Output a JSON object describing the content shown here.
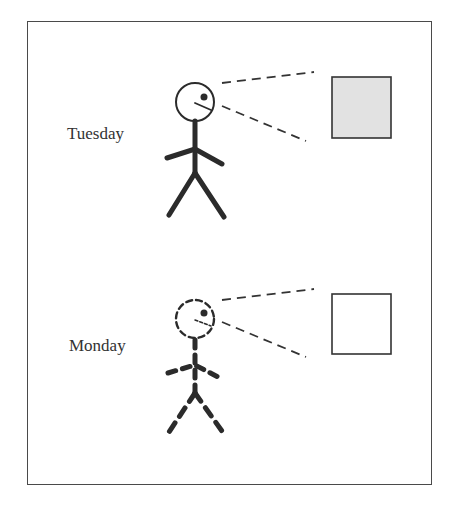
{
  "panels": [
    {
      "day_label": "Tuesday",
      "figure_style": "solid",
      "object_fill": "#e2e2e2"
    },
    {
      "day_label": "Monday",
      "figure_style": "dashed",
      "object_fill": "#ffffff"
    }
  ],
  "colors": {
    "stroke": "#2b2b2b",
    "frame": "#4a4a4a",
    "object_gray": "#e2e2e2"
  }
}
